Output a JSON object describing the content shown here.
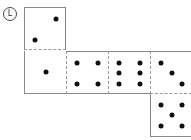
{
  "label": "L",
  "net": {
    "faces": [
      {
        "name": "top",
        "pips": 2
      },
      {
        "name": "row-1",
        "pips": 1
      },
      {
        "name": "row-2",
        "pips": 4
      },
      {
        "name": "row-3",
        "pips": 6
      },
      {
        "name": "row-4",
        "pips": 3
      },
      {
        "name": "bottom",
        "pips": 5
      }
    ],
    "colors": {
      "pip": "#111111",
      "edge": "#888888",
      "fold": "#999999"
    }
  }
}
